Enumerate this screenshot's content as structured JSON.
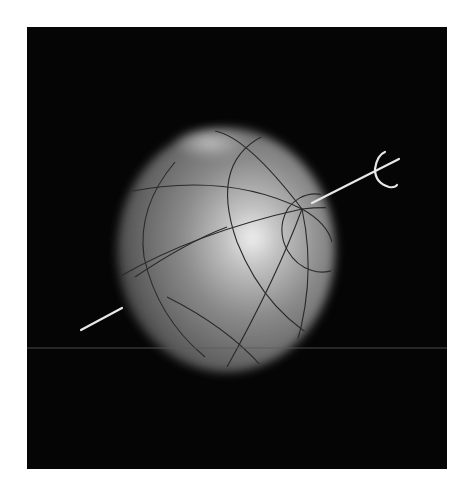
{
  "figure": {
    "background_color": "#050505",
    "sphere": {
      "base_color": "#7a7a7a",
      "highlight_color": "#f2f2f2",
      "grid_color": "#2a2a2a"
    },
    "axis": {
      "color": "#e8e8e8",
      "rotation_arrow": "curved-arrow"
    },
    "horizon_line_color": "#5a5a5a"
  }
}
